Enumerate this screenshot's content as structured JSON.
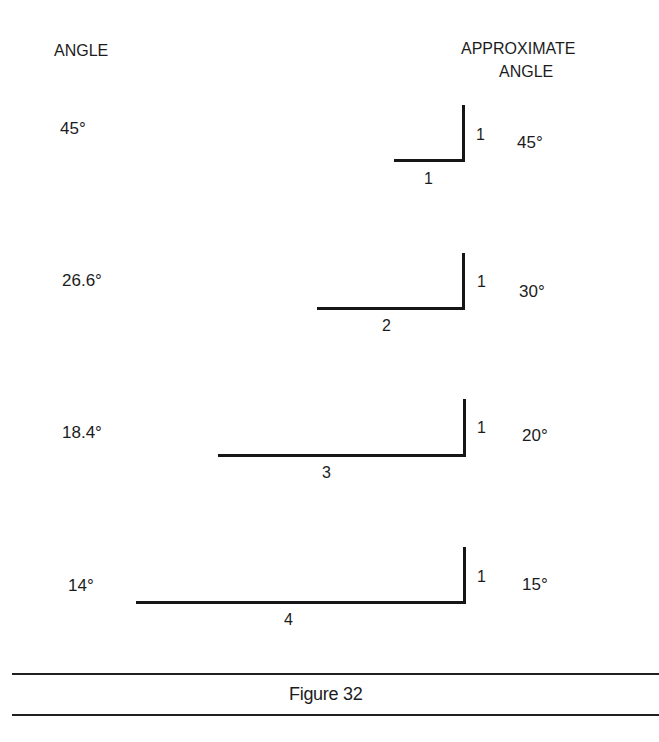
{
  "headers": {
    "left": "ANGLE",
    "right_line1": "APPROXIMATE",
    "right_line2": "ANGLE"
  },
  "rows": [
    {
      "angle": "45°",
      "rise": "1",
      "run": "1",
      "approx": "45°"
    },
    {
      "angle": "26.6°",
      "rise": "1",
      "run": "2",
      "approx": "30°"
    },
    {
      "angle": "18.4°",
      "rise": "1",
      "run": "3",
      "approx": "20°"
    },
    {
      "angle": "14°",
      "rise": "1",
      "run": "4",
      "approx": "15°"
    }
  ],
  "caption": "Figure 32",
  "colors": {
    "ink": "#161616",
    "background": "#ffffff"
  }
}
